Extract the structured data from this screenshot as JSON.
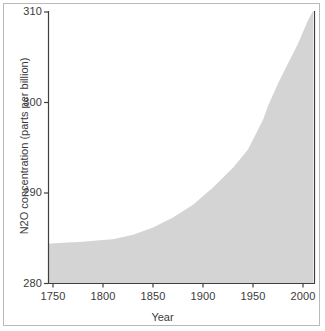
{
  "chart_data": {
    "type": "area",
    "title": "",
    "xlabel": "Year",
    "ylabel": "N2O concentration (parts per billion)",
    "xlim": [
      1745,
      2012
    ],
    "ylim": [
      280,
      310
    ],
    "xticks": [
      1750,
      1800,
      1850,
      1900,
      1950,
      2000
    ],
    "xtick_labels": [
      "1750",
      "1800",
      "1850",
      "1900",
      "1950",
      "2000"
    ],
    "yticks": [
      280,
      290,
      300,
      310
    ],
    "ytick_labels": [
      "280",
      "290",
      "300",
      "310"
    ],
    "grid": false,
    "legend": null,
    "fill_color": "#d4d4d4",
    "axis_color": "#3f3f3f",
    "background_color": "#ffffff",
    "baseline": 280,
    "series": [
      {
        "name": "N2O concentration",
        "x": [
          1745,
          1760,
          1780,
          1800,
          1810,
          1830,
          1850,
          1870,
          1890,
          1910,
          1930,
          1945,
          1960,
          1965,
          1975,
          1985,
          1995,
          2005,
          2010
        ],
        "values": [
          284.4,
          284.5,
          284.6,
          284.8,
          284.9,
          285.4,
          286.2,
          287.3,
          288.7,
          290.6,
          292.8,
          294.8,
          298.1,
          299.6,
          302.1,
          304.3,
          306.5,
          309.1,
          310.1
        ]
      }
    ]
  },
  "axis_titles": {
    "x": "Year",
    "y": "N2O concentration (parts per billion)"
  }
}
